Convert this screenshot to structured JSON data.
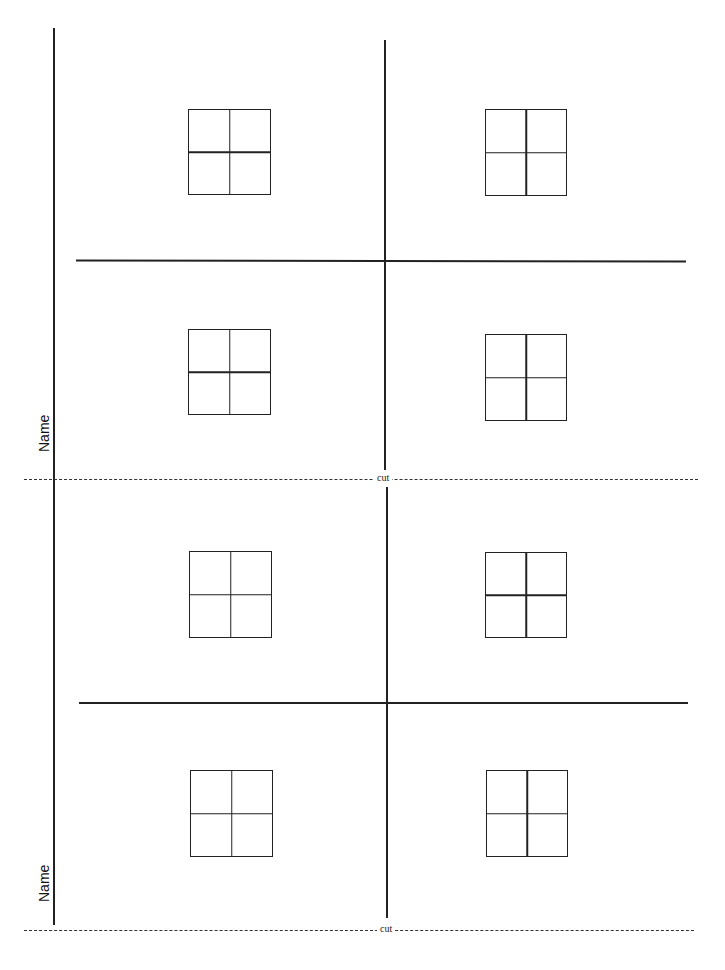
{
  "page": {
    "name_labels": [
      "Name",
      "Name"
    ],
    "cut_labels": [
      "cut",
      "cut"
    ]
  },
  "grids": [
    {
      "id": "grid-1",
      "x": 188,
      "y": 109,
      "w": 83,
      "h": 86
    },
    {
      "id": "grid-2",
      "x": 485,
      "y": 109,
      "w": 82,
      "h": 87
    },
    {
      "id": "grid-3",
      "x": 188,
      "y": 329,
      "w": 83,
      "h": 86
    },
    {
      "id": "grid-4",
      "x": 485,
      "y": 334,
      "w": 82,
      "h": 87
    },
    {
      "id": "grid-5",
      "x": 189,
      "y": 551,
      "w": 83,
      "h": 87
    },
    {
      "id": "grid-6",
      "x": 485,
      "y": 552,
      "w": 82,
      "h": 86
    },
    {
      "id": "grid-7",
      "x": 190,
      "y": 770,
      "w": 83,
      "h": 87
    },
    {
      "id": "grid-8",
      "x": 486,
      "y": 770,
      "w": 82,
      "h": 87
    }
  ]
}
